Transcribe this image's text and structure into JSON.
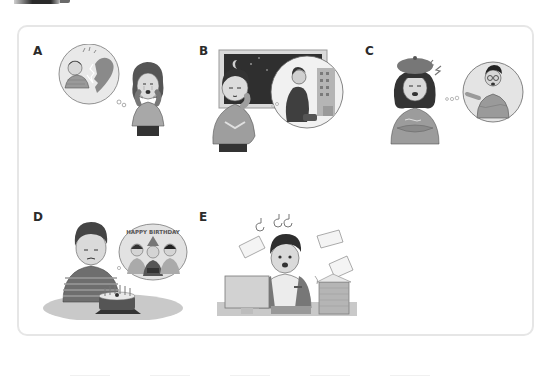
{
  "header": {
    "mark": "section-header-fragment"
  },
  "exercise": {
    "panels": [
      {
        "label": "A",
        "description": "Woman crying, hands on face; thought bubble shows a man and a broken heart",
        "icon": "broken-heart-icon"
      },
      {
        "label": "B",
        "description": "Boy with hand on chin by a night window; bubble shows a man walking away with a bag toward a building",
        "icon": "moon-window-icon"
      },
      {
        "label": "C",
        "description": "Girl in beret with crossed arms, annoyed; bubble shows a man in glasses pointing and shouting",
        "icon": "lightning-anger-icon"
      },
      {
        "label": "D",
        "description": "Sad boy at table with birthday cake; bubble shows friends celebrating under a banner",
        "banner_text": "HAPPY BIRTHDAY",
        "icon": "birthday-cake-icon"
      },
      {
        "label": "E",
        "description": "Stressed man at computer with flying papers and stacks of documents",
        "icon": "computer-icon"
      }
    ]
  },
  "colors": {
    "frame_border": "#e6e6e6",
    "label_text": "#2b2b2b",
    "illustration_dark": "#3a3a3a",
    "illustration_mid": "#8a8a8a",
    "illustration_light": "#c8c8c8"
  }
}
